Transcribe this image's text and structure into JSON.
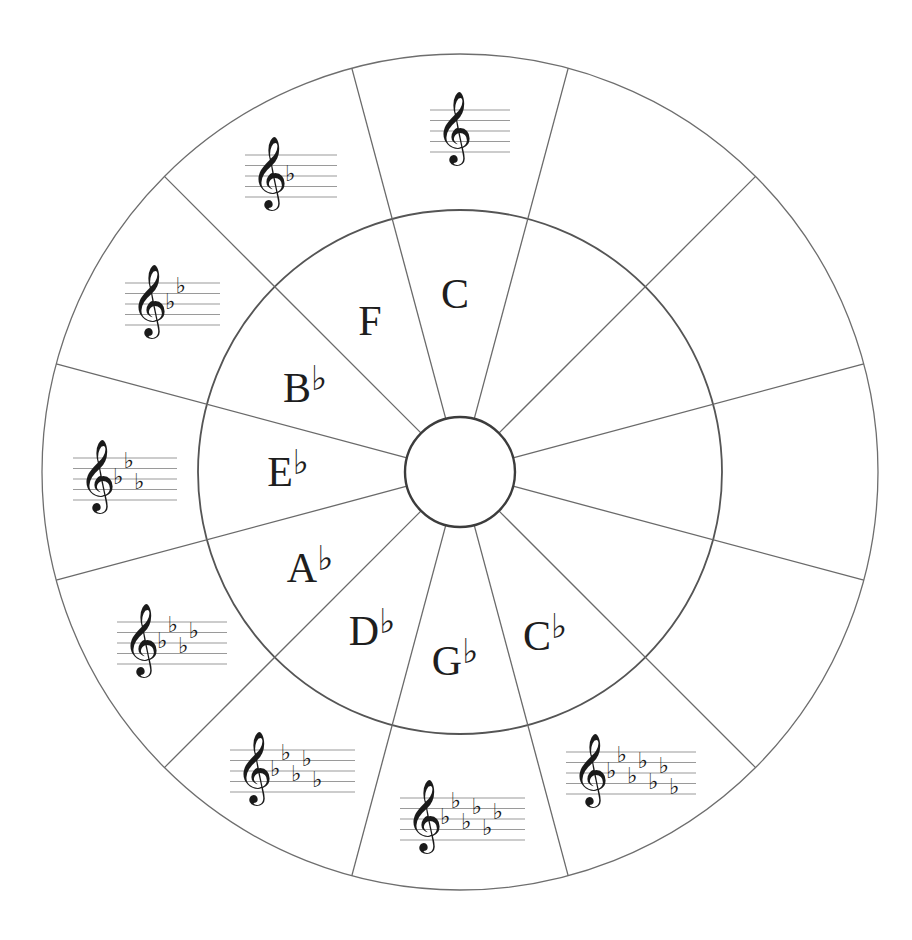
{
  "diagram": {
    "type": "circle-of-fifths-worksheet",
    "colors": {
      "background": "#ffffff",
      "lines": "#6e6e6e",
      "text": "#1e1e1e",
      "staff": "#9a9a9a"
    },
    "geometry": {
      "cx": 460,
      "cy": 472,
      "outer_radius": 418,
      "inner_radius": 262,
      "hub_radius": 55,
      "segments": 12
    },
    "clef_glyph": "𝄞",
    "flat_glyph": "♭",
    "flat_order": [
      "B",
      "E",
      "A",
      "D",
      "G",
      "C",
      "F"
    ],
    "segments": [
      {
        "position": 0,
        "angle_deg": 0,
        "key": "C",
        "accidental": "",
        "flats": 0,
        "filled": true
      },
      {
        "position": 1,
        "angle_deg": 30,
        "key": "",
        "accidental": "",
        "flats": null,
        "filled": false
      },
      {
        "position": 2,
        "angle_deg": 60,
        "key": "",
        "accidental": "",
        "flats": null,
        "filled": false
      },
      {
        "position": 3,
        "angle_deg": 90,
        "key": "",
        "accidental": "",
        "flats": null,
        "filled": false
      },
      {
        "position": 4,
        "angle_deg": 120,
        "key": "",
        "accidental": "",
        "flats": null,
        "filled": false
      },
      {
        "position": 5,
        "angle_deg": 150,
        "key": "C",
        "accidental": "♭",
        "flats": 7,
        "filled": true
      },
      {
        "position": 6,
        "angle_deg": 180,
        "key": "G",
        "accidental": "♭",
        "flats": 6,
        "filled": true
      },
      {
        "position": 7,
        "angle_deg": 210,
        "key": "D",
        "accidental": "♭",
        "flats": 5,
        "filled": true
      },
      {
        "position": 8,
        "angle_deg": 240,
        "key": "A",
        "accidental": "♭",
        "flats": 4,
        "filled": true
      },
      {
        "position": 9,
        "angle_deg": 270,
        "key": "E",
        "accidental": "♭",
        "flats": 3,
        "filled": true
      },
      {
        "position": 10,
        "angle_deg": 300,
        "key": "B",
        "accidental": "♭",
        "flats": 2,
        "filled": true
      },
      {
        "position": 11,
        "angle_deg": 330,
        "key": "F",
        "accidental": "",
        "flats": 1,
        "filled": true
      }
    ],
    "inner_labels": [
      {
        "text": "C",
        "acc": "",
        "x": 455,
        "y": 308
      },
      {
        "text": "F",
        "acc": "",
        "x": 370,
        "y": 335
      },
      {
        "text": "B",
        "acc": "♭",
        "x": 305,
        "y": 402
      },
      {
        "text": "E",
        "acc": "♭",
        "x": 288,
        "y": 486
      },
      {
        "text": "A",
        "acc": "♭",
        "x": 310,
        "y": 582
      },
      {
        "text": "D",
        "acc": "♭",
        "x": 372,
        "y": 645
      },
      {
        "text": "G",
        "acc": "♭",
        "x": 455,
        "y": 675
      },
      {
        "text": "C",
        "acc": "♭",
        "x": 545,
        "y": 650
      }
    ],
    "staves": [
      {
        "key": "C",
        "flats": 0,
        "x": 430,
        "y": 110,
        "width": 80
      },
      {
        "key": "F",
        "flats": 1,
        "x": 245,
        "y": 155,
        "width": 92
      },
      {
        "key": "Bb",
        "flats": 2,
        "x": 125,
        "y": 283,
        "width": 95
      },
      {
        "key": "Eb",
        "flats": 3,
        "x": 73,
        "y": 458,
        "width": 104
      },
      {
        "key": "Ab",
        "flats": 4,
        "x": 117,
        "y": 622,
        "width": 110
      },
      {
        "key": "Db",
        "flats": 5,
        "x": 230,
        "y": 750,
        "width": 125
      },
      {
        "key": "Gb",
        "flats": 6,
        "x": 400,
        "y": 798,
        "width": 125
      },
      {
        "key": "Cb",
        "flats": 7,
        "x": 566,
        "y": 752,
        "width": 130
      }
    ]
  }
}
